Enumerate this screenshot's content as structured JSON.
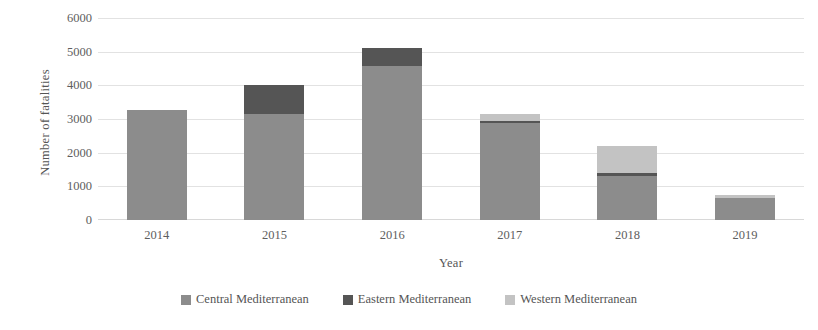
{
  "chart_data": {
    "type": "bar",
    "subtype": "stacked-bar",
    "title": "",
    "xlabel": "Year",
    "ylabel": "Number of fatalities",
    "categories": [
      "2014",
      "2015",
      "2016",
      "2017",
      "2018",
      "2019"
    ],
    "series": [
      {
        "name": "Central Mediterranean",
        "color": "#8c8c8c",
        "values": [
          3280,
          3150,
          4580,
          2870,
          1310,
          650
        ]
      },
      {
        "name": "Eastern Mediterranean",
        "color": "#555555",
        "values": [
          0,
          870,
          520,
          60,
          90,
          0
        ]
      },
      {
        "name": "Western Mediterranean",
        "color": "#c3c3c3",
        "values": [
          0,
          0,
          0,
          210,
          810,
          100
        ]
      }
    ],
    "totals": [
      3280,
      4020,
      5100,
      3140,
      2210,
      750
    ],
    "ylim": [
      0,
      6000
    ],
    "yticks": [
      "0",
      "1000",
      "2000",
      "3000",
      "4000",
      "5000",
      "6000"
    ],
    "ytick_values": [
      0,
      1000,
      2000,
      3000,
      4000,
      5000,
      6000
    ],
    "grid": true,
    "legend_position": "bottom"
  },
  "legend": {
    "items": [
      {
        "label": "Central Mediterranean",
        "color": "#8c8c8c"
      },
      {
        "label": "Eastern Mediterranean",
        "color": "#555555"
      },
      {
        "label": "Western Mediterranean",
        "color": "#c3c3c3"
      }
    ]
  }
}
